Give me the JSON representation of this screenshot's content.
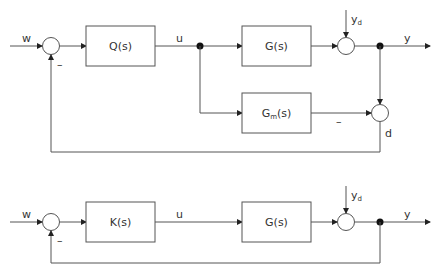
{
  "diagrams": [
    {
      "name": "IMC structure",
      "signals": {
        "input": "w",
        "minus_sign": "–",
        "control": "u",
        "disturbance": "y",
        "disturbance_sub": "d",
        "output": "y",
        "model_minus": "–",
        "model_error": "d"
      },
      "blocks": {
        "controller": "Q(s)",
        "plant": "G(s)",
        "model_main": "G",
        "model_sub": "m",
        "model_tail": "(s)"
      }
    },
    {
      "name": "Classic feedback structure",
      "signals": {
        "input": "w",
        "minus_sign": "–",
        "control": "u",
        "disturbance": "y",
        "disturbance_sub": "d",
        "output": "y"
      },
      "blocks": {
        "controller": "K(s)",
        "plant": "G(s)"
      }
    }
  ],
  "colors": {
    "line": "#555555",
    "text": "#333333",
    "background": "#ffffff"
  }
}
